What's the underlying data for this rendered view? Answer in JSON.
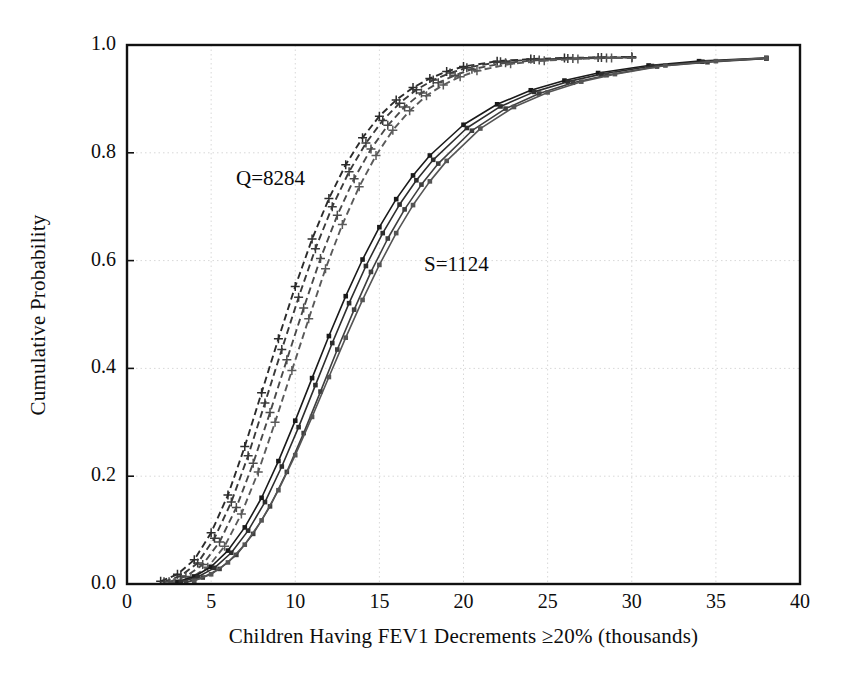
{
  "chart_data": {
    "type": "line",
    "title": "",
    "xlabel": "Children Having FEV1 Decrements ≥20% (thousands)",
    "ylabel": "Cumulative Probability",
    "xlim": [
      0,
      40
    ],
    "ylim": [
      0.0,
      1.0
    ],
    "xticks": [
      0,
      5,
      10,
      15,
      20,
      25,
      30,
      35,
      40
    ],
    "xtick_labels": [
      "0",
      "5",
      "10",
      "15",
      "20",
      "25",
      "30",
      "35",
      "40"
    ],
    "yticks": [
      0.0,
      0.2,
      0.4,
      0.6,
      0.8,
      1.0
    ],
    "ytick_labels": [
      "0.0",
      "0.2",
      "0.4",
      "0.6",
      "0.8",
      "1.0"
    ],
    "grid": true,
    "grid_style": "dotted",
    "grid_color": "#d8d8d8",
    "legend_position": "none",
    "annotations": [
      {
        "text": "Q=8284",
        "x": 8.0,
        "y": 0.755
      },
      {
        "text": "S=1124",
        "x": 19.0,
        "y": 0.585
      }
    ],
    "series": [
      {
        "name": "Q=8284 curve 1",
        "group": "Q",
        "linestyle": "dashed",
        "marker": "plus",
        "color": "#2b2b2b",
        "x": [
          2.0,
          3.0,
          4.0,
          5.0,
          6.0,
          7.0,
          8.0,
          9.0,
          10.0,
          11.0,
          12.0,
          13.0,
          14.0,
          15.0,
          16.0,
          17.0,
          18.0,
          19.0,
          20.0,
          22.0,
          24.0,
          26.0,
          28.0,
          30.0
        ],
        "y": [
          0.005,
          0.018,
          0.045,
          0.095,
          0.165,
          0.255,
          0.355,
          0.455,
          0.552,
          0.64,
          0.715,
          0.778,
          0.828,
          0.868,
          0.898,
          0.921,
          0.938,
          0.951,
          0.96,
          0.97,
          0.974,
          0.976,
          0.977,
          0.978
        ]
      },
      {
        "name": "Q=8284 curve 2",
        "group": "Q",
        "linestyle": "dashed",
        "marker": "plus",
        "color": "#3a3a3a",
        "x": [
          2.2,
          3.2,
          4.2,
          5.2,
          6.2,
          7.2,
          8.2,
          9.2,
          10.2,
          11.2,
          12.2,
          13.2,
          14.2,
          15.2,
          16.2,
          17.2,
          18.2,
          19.2,
          20.2,
          22.2,
          24.2,
          26.2,
          28.2,
          30.0
        ],
        "y": [
          0.004,
          0.015,
          0.039,
          0.085,
          0.152,
          0.238,
          0.336,
          0.435,
          0.532,
          0.622,
          0.7,
          0.765,
          0.818,
          0.86,
          0.892,
          0.917,
          0.935,
          0.948,
          0.958,
          0.969,
          0.973,
          0.975,
          0.977,
          0.977
        ]
      },
      {
        "name": "Q=8284 curve 3",
        "group": "Q",
        "linestyle": "dashed",
        "marker": "plus",
        "color": "#4a4a4a",
        "x": [
          2.5,
          3.5,
          4.5,
          5.5,
          6.5,
          7.5,
          8.5,
          9.5,
          10.5,
          11.5,
          12.5,
          13.5,
          14.5,
          15.5,
          16.5,
          17.5,
          18.5,
          19.5,
          20.5,
          22.5,
          24.5,
          26.5,
          28.5,
          30.0
        ],
        "y": [
          0.004,
          0.014,
          0.036,
          0.078,
          0.142,
          0.224,
          0.318,
          0.416,
          0.512,
          0.604,
          0.684,
          0.752,
          0.807,
          0.851,
          0.885,
          0.911,
          0.93,
          0.944,
          0.955,
          0.967,
          0.972,
          0.975,
          0.976,
          0.977
        ]
      },
      {
        "name": "Q=8284 curve 4",
        "group": "Q",
        "linestyle": "dashed",
        "marker": "plus",
        "color": "#5a5a5a",
        "x": [
          2.8,
          3.8,
          4.8,
          5.8,
          6.8,
          7.8,
          8.8,
          9.8,
          10.8,
          11.8,
          12.8,
          13.8,
          14.8,
          15.8,
          16.8,
          17.8,
          18.8,
          19.8,
          20.8,
          22.8,
          24.8,
          26.8,
          28.8,
          30.0
        ],
        "y": [
          0.003,
          0.012,
          0.031,
          0.07,
          0.13,
          0.208,
          0.3,
          0.396,
          0.492,
          0.585,
          0.667,
          0.737,
          0.795,
          0.842,
          0.878,
          0.906,
          0.926,
          0.941,
          0.952,
          0.965,
          0.971,
          0.974,
          0.976,
          0.976
        ]
      },
      {
        "name": "S=1124 curve 1",
        "group": "S",
        "linestyle": "solid",
        "marker": "square",
        "color": "#1a1a1a",
        "x": [
          3.0,
          4.0,
          5.0,
          6.0,
          7.0,
          8.0,
          9.0,
          10.0,
          11.0,
          12.0,
          13.0,
          14.0,
          15.0,
          16.0,
          17.0,
          18.0,
          20.0,
          22.0,
          24.0,
          26.0,
          28.0,
          31.0,
          34.0,
          38.0
        ],
        "y": [
          0.004,
          0.014,
          0.032,
          0.062,
          0.105,
          0.16,
          0.228,
          0.303,
          0.382,
          0.46,
          0.534,
          0.602,
          0.662,
          0.714,
          0.758,
          0.795,
          0.852,
          0.89,
          0.916,
          0.934,
          0.948,
          0.962,
          0.97,
          0.976
        ]
      },
      {
        "name": "S=1124 curve 2",
        "group": "S",
        "linestyle": "solid",
        "marker": "square",
        "color": "#2e2e2e",
        "x": [
          3.2,
          4.2,
          5.2,
          6.2,
          7.2,
          8.2,
          9.2,
          10.2,
          11.2,
          12.2,
          13.2,
          14.2,
          15.2,
          16.2,
          17.2,
          18.2,
          20.2,
          22.2,
          24.2,
          26.2,
          28.2,
          31.2,
          34.2,
          38.0
        ],
        "y": [
          0.004,
          0.013,
          0.03,
          0.058,
          0.099,
          0.152,
          0.218,
          0.291,
          0.369,
          0.447,
          0.521,
          0.59,
          0.651,
          0.704,
          0.749,
          0.787,
          0.846,
          0.886,
          0.913,
          0.932,
          0.946,
          0.961,
          0.969,
          0.975
        ]
      },
      {
        "name": "S=1124 curve 3",
        "group": "S",
        "linestyle": "solid",
        "marker": "square",
        "color": "#3f3f3f",
        "x": [
          3.5,
          4.5,
          5.5,
          6.5,
          7.5,
          8.5,
          9.5,
          10.5,
          11.5,
          12.5,
          13.5,
          14.5,
          15.5,
          16.5,
          17.5,
          18.5,
          20.5,
          22.5,
          24.5,
          26.5,
          28.5,
          31.5,
          34.5,
          38.0
        ],
        "y": [
          0.003,
          0.012,
          0.028,
          0.054,
          0.093,
          0.144,
          0.208,
          0.28,
          0.357,
          0.435,
          0.509,
          0.579,
          0.641,
          0.695,
          0.741,
          0.78,
          0.841,
          0.882,
          0.91,
          0.93,
          0.944,
          0.96,
          0.968,
          0.975
        ]
      },
      {
        "name": "S=1124 curve 4",
        "group": "S",
        "linestyle": "solid",
        "marker": "square",
        "color": "#555555",
        "x": [
          4.0,
          5.0,
          6.0,
          7.0,
          8.0,
          9.0,
          10.0,
          11.0,
          12.0,
          13.0,
          14.0,
          15.0,
          16.0,
          17.0,
          18.0,
          19.0,
          21.0,
          23.0,
          25.0,
          27.0,
          29.0,
          32.0,
          35.0,
          38.0
        ],
        "y": [
          0.006,
          0.018,
          0.04,
          0.073,
          0.118,
          0.174,
          0.239,
          0.31,
          0.384,
          0.457,
          0.527,
          0.592,
          0.651,
          0.703,
          0.747,
          0.785,
          0.845,
          0.885,
          0.912,
          0.932,
          0.946,
          0.962,
          0.97,
          0.976
        ]
      }
    ]
  },
  "ticks": {
    "x": [
      "0",
      "5",
      "10",
      "15",
      "20",
      "25",
      "30",
      "35",
      "40"
    ],
    "y": [
      "1.0",
      "0.8",
      "0.6",
      "0.4",
      "0.2",
      "0.0"
    ]
  },
  "labels": {
    "x_axis": "Children Having FEV1 Decrements ≥20% (thousands)",
    "y_axis": "Cumulative Probability"
  },
  "annotations": {
    "q": "Q=8284",
    "s": "S=1124"
  }
}
